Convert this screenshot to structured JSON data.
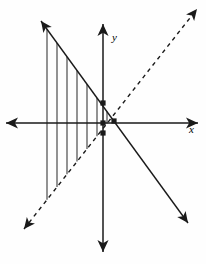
{
  "figure": {
    "background_color": "#fefefe",
    "stroke_color": "#1a1a1a",
    "hatch_color": "#3a3a3a",
    "width": 206,
    "height": 264
  },
  "axes": {
    "origin": {
      "x": 103,
      "y": 123
    },
    "x_axis": {
      "label": "x",
      "label_pos": {
        "x": 189,
        "y": 134
      },
      "start": {
        "x": 6,
        "y": 123
      },
      "end": {
        "x": 198,
        "y": 123
      },
      "arrow_start": true,
      "arrow_end": true
    },
    "y_axis": {
      "label": "y",
      "label_pos": {
        "x": 112,
        "y": 42
      },
      "start": {
        "x": 103,
        "y": 24
      },
      "end": {
        "x": 103,
        "y": 252
      },
      "arrow_start": true,
      "arrow_end": true
    }
  },
  "lines": [
    {
      "name": "solid-descending-line",
      "style": "solid",
      "start": {
        "x": 41,
        "y": 21
      },
      "end": {
        "x": 188,
        "y": 223
      },
      "arrow_start": true,
      "arrow_end": true,
      "slope_sign": "negative"
    },
    {
      "name": "dashed-identity-line",
      "style": "dashed",
      "dash_pattern": "4,4",
      "start": {
        "x": 24,
        "y": 229
      },
      "end": {
        "x": 197,
        "y": 9
      },
      "arrow_start": true,
      "arrow_end": true,
      "slope_sign": "positive"
    }
  ],
  "hatching": {
    "name": "vertical-hatch-fill",
    "orientation": "vertical",
    "count": 9,
    "x_start": 47,
    "x_step": 10,
    "upper_boundary": "solid-descending-line",
    "lower_boundary": "dashed-identity-line"
  },
  "points": [
    {
      "name": "point-on-y-axis-upper",
      "x": 103,
      "y": 103,
      "shape": "square"
    },
    {
      "name": "point-at-origin",
      "x": 103,
      "y": 123,
      "shape": "square"
    },
    {
      "name": "point-on-y-axis-lower",
      "x": 103,
      "y": 133,
      "shape": "square"
    },
    {
      "name": "point-intersection",
      "x": 114,
      "y": 121,
      "shape": "square"
    }
  ]
}
